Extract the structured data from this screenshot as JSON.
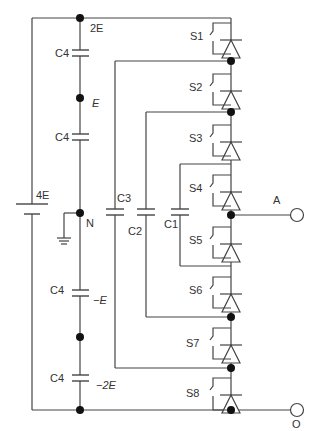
{
  "diagram": {
    "type": "flying-capacitor multilevel inverter leg (8 switches)",
    "source": {
      "label": "4E"
    },
    "dc_link_nodes": [
      {
        "label": "2E"
      },
      {
        "label": "E"
      },
      {
        "label": "N"
      },
      {
        "label": "−E"
      },
      {
        "label": "−2E"
      }
    ],
    "dc_capacitors": [
      {
        "label": "C4"
      },
      {
        "label": "C4"
      },
      {
        "label": "C4"
      },
      {
        "label": "C4"
      }
    ],
    "flying_capacitors": [
      {
        "label": "C3"
      },
      {
        "label": "C2"
      },
      {
        "label": "C1"
      }
    ],
    "switches": [
      {
        "label": "S1"
      },
      {
        "label": "S2"
      },
      {
        "label": "S3"
      },
      {
        "label": "S4"
      },
      {
        "label": "S5"
      },
      {
        "label": "S6"
      },
      {
        "label": "S7"
      },
      {
        "label": "S8"
      }
    ],
    "terminals": [
      {
        "label": "A"
      },
      {
        "label": "O"
      }
    ],
    "colors": {
      "line": "#444444",
      "node": "#111111",
      "background": "#ffffff"
    }
  }
}
